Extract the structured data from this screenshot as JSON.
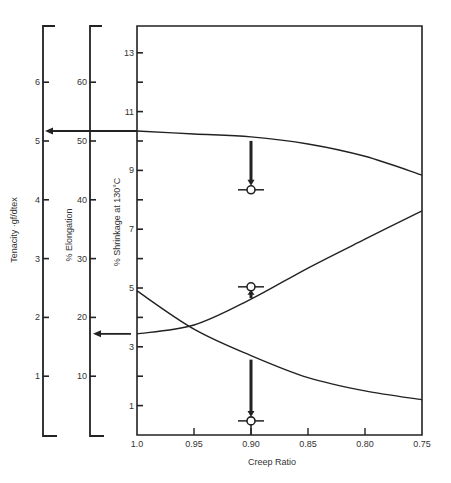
{
  "chart_data": {
    "type": "line",
    "title": "",
    "xlabel": "Creep Ratio",
    "x_ticks": [
      "1.0",
      "0.95",
      "0.90",
      "0.85",
      "0.80",
      "0.75"
    ],
    "x": [
      1.0,
      0.95,
      0.9,
      0.85,
      0.8,
      0.75
    ],
    "xlim": [
      1.0,
      0.75
    ],
    "grid": false,
    "legend": "none",
    "axes": [
      {
        "name": "tenacity",
        "label": "Tenacity ·gf/dtex",
        "ticks": [
          "1",
          "2",
          "3",
          "4",
          "5",
          "6"
        ],
        "range": [
          0,
          6.8
        ]
      },
      {
        "name": "elongation",
        "label": "% Elongation",
        "ticks": [
          "10",
          "20",
          "30",
          "40",
          "50",
          "60"
        ],
        "range": [
          0,
          68
        ]
      },
      {
        "name": "shrinkage",
        "label": "% Shrinkage at 130°C",
        "ticks": [
          "1",
          "3",
          "5",
          "7",
          "9",
          "11",
          "13"
        ],
        "range": [
          0,
          13.8
        ]
      }
    ],
    "series": [
      {
        "name": "Tenacity",
        "axis": "tenacity",
        "values": [
          5.17,
          5.12,
          5.07,
          4.95,
          4.74,
          4.42
        ]
      },
      {
        "name": "Elongation",
        "axis": "elongation",
        "values": [
          17.2,
          18.7,
          23.1,
          28.4,
          33.3,
          38.1
        ]
      },
      {
        "name": "Shrinkage",
        "axis": "shrinkage",
        "values": [
          4.9,
          3.6,
          2.7,
          1.95,
          1.5,
          1.2
        ]
      }
    ],
    "markers": [
      {
        "x": 0.9,
        "axis": "tenacity",
        "value": 4.17,
        "arrow": "down-from-curve"
      },
      {
        "x": 0.9,
        "axis": "elongation",
        "value": 25.2,
        "arrow": "up-from-curve"
      },
      {
        "x": 0.9,
        "axis": "shrinkage",
        "value": 0.48,
        "arrow": "down-from-curve"
      }
    ],
    "annotations": [
      {
        "type": "arrow",
        "from_axis": "shrinkage-plot-left",
        "to_axis": "tenacity",
        "value": 5.17
      },
      {
        "type": "arrow",
        "from_axis": "shrinkage-plot-left",
        "to_axis": "elongation",
        "value": 17.2
      }
    ]
  }
}
